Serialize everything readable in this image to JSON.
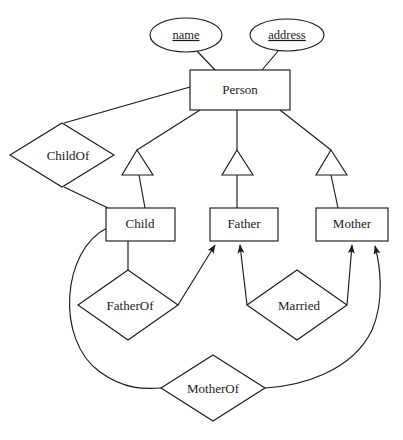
{
  "diagram": {
    "type": "entity-relationship-diagram",
    "notation": "chen-er-with-isa",
    "background_color": "#ffffff",
    "line_color": "#1a1a1a",
    "text_color": "#1a1a1a",
    "attributes": [
      {
        "id": "name",
        "label": "name",
        "shape": "ellipse",
        "is_key": true,
        "underlined": true,
        "cx": 186,
        "cy": 35,
        "rx": 36,
        "ry": 17,
        "attached_to": "Person"
      },
      {
        "id": "address",
        "label": "address",
        "shape": "ellipse",
        "is_key": true,
        "underlined": true,
        "cx": 287,
        "cy": 35,
        "rx": 37,
        "ry": 16,
        "attached_to": "Person"
      }
    ],
    "entities": [
      {
        "id": "person",
        "label": "Person",
        "shape": "rectangle",
        "x": 190,
        "y": 70,
        "width": 100,
        "height": 40,
        "is_superclass": true
      },
      {
        "id": "child",
        "label": "Child",
        "shape": "rectangle",
        "x": 106,
        "y": 208,
        "width": 69,
        "height": 33,
        "isa_parent": "Person"
      },
      {
        "id": "father",
        "label": "Father",
        "shape": "rectangle",
        "x": 210,
        "y": 208,
        "width": 68,
        "height": 33,
        "isa_parent": "Person"
      },
      {
        "id": "mother",
        "label": "Mother",
        "shape": "rectangle",
        "x": 316,
        "y": 208,
        "width": 72,
        "height": 33,
        "isa_parent": "Person"
      }
    ],
    "relationships": [
      {
        "id": "childof",
        "label": "ChildOf",
        "shape": "diamond",
        "cx": 62,
        "cy": 155,
        "rx": 52,
        "ry": 32,
        "connects": [
          "Person",
          "Child"
        ]
      },
      {
        "id": "fatherof",
        "label": "FatherOf",
        "shape": "diamond",
        "cx": 128,
        "cy": 305,
        "rx": 50,
        "ry": 35,
        "connects": [
          "Child",
          "Father"
        ]
      },
      {
        "id": "married",
        "label": "Married",
        "shape": "diamond",
        "cx": 297,
        "cy": 305,
        "rx": 50,
        "ry": 35,
        "connects": [
          "Father",
          "Mother"
        ]
      },
      {
        "id": "motherof",
        "label": "MotherOf",
        "shape": "diamond",
        "cx": 213,
        "cy": 388,
        "rx": 52,
        "ry": 33,
        "connects": [
          "Child",
          "Mother"
        ]
      }
    ],
    "isa_triangles": [
      {
        "id": "isa-child",
        "for_entity": "Child",
        "apex_x": 137,
        "apex_y": 150
      },
      {
        "id": "isa-father",
        "for_entity": "Father",
        "apex_x": 237,
        "apex_y": 150
      },
      {
        "id": "isa-mother",
        "for_entity": "Mother",
        "apex_x": 331,
        "apex_y": 150
      }
    ],
    "arrow_edges": [
      {
        "id": "fatherof-to-father",
        "from": "FatherOf",
        "to": "Father",
        "arrowhead": true
      },
      {
        "id": "married-to-father",
        "from": "Married",
        "to": "Father",
        "arrowhead": true
      },
      {
        "id": "married-to-mother",
        "from": "Married",
        "to": "Mother",
        "arrowhead": true
      },
      {
        "id": "motherof-to-mother",
        "from": "MotherOf",
        "to": "Mother",
        "arrowhead": true
      }
    ]
  }
}
